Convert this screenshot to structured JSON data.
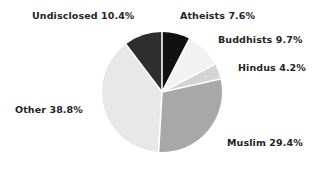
{
  "chart_data": {
    "type": "pie",
    "title": "",
    "xlabel": "",
    "ylabel": "",
    "legend_position": "none",
    "grid": false,
    "units": "percent",
    "start_angle_deg": 0,
    "direction": "clockwise",
    "categories": [
      "Atheists",
      "Buddhists",
      "Hindus",
      "Muslim",
      "Other",
      "Undisclosed"
    ],
    "values": [
      7.6,
      9.7,
      4.2,
      29.4,
      38.8,
      10.4
    ],
    "colors": [
      "#111111",
      "#f2f2f2",
      "#d4d4d4",
      "#a8a8a8",
      "#e8e8e8",
      "#2e2e2e"
    ],
    "slices": [
      {
        "label": "Atheists",
        "value": 7.6,
        "annotation": "Atheists 7.6%",
        "color": "#111111",
        "start_deg": 0,
        "end_deg": 27.36
      },
      {
        "label": "Buddhists",
        "value": 9.7,
        "annotation": "Buddhists 9.7%",
        "color": "#f2f2f2",
        "start_deg": 27.36,
        "end_deg": 62.28
      },
      {
        "label": "Hindus",
        "value": 4.2,
        "annotation": "Hindus 4.2%",
        "color": "#d4d4d4",
        "start_deg": 62.28,
        "end_deg": 77.4
      },
      {
        "label": "Muslim",
        "value": 29.4,
        "annotation": "Muslim 29.4%",
        "color": "#a8a8a8",
        "start_deg": 77.4,
        "end_deg": 183.24
      },
      {
        "label": "Other",
        "value": 38.8,
        "annotation": "Other 38.8%",
        "color": "#e8e8e8",
        "start_deg": 183.24,
        "end_deg": 322.92
      },
      {
        "label": "Undisclosed",
        "value": 10.4,
        "annotation": "Undisclosed 10.4%",
        "color": "#2e2e2e",
        "start_deg": 322.92,
        "end_deg": 360
      }
    ],
    "geometry": {
      "center_x": 162,
      "center_y": 92,
      "radius": 60,
      "separator_color": "#ffffff",
      "separator_width": 1.6
    },
    "background_color": "#ffffff",
    "label_color": "#232323"
  },
  "labels": {
    "undisclosed": "Undisclosed 10.4%",
    "atheists": "Atheists 7.6%",
    "buddhists": "Buddhists 9.7%",
    "hindus": "Hindus 4.2%",
    "muslim": "Muslim 29.4%",
    "other": "Other 38.8%"
  }
}
